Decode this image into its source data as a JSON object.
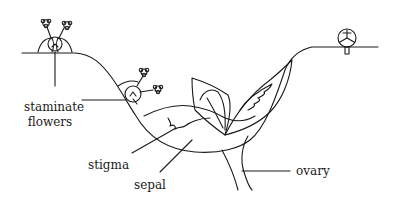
{
  "figure": {
    "type": "botanical-illustration"
  },
  "labels": {
    "staminate_line1": "staminate",
    "staminate_line2": "flowers",
    "stigma": "stigma",
    "sepal": "sepal",
    "ovary": "ovary"
  },
  "colors": {
    "ink": "#1a1a1a",
    "background": "#ffffff"
  }
}
